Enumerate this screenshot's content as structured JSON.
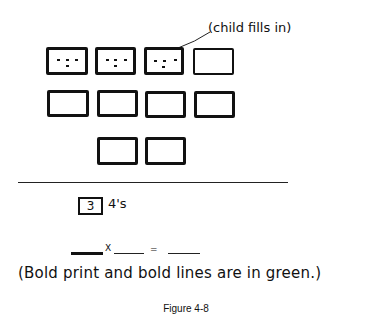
{
  "annotation": {
    "label": "(child fills in)"
  },
  "grid": {
    "rows": [
      {
        "boxes": [
          {
            "dots": 3
          },
          {
            "dots": 3
          },
          {
            "dots": 3,
            "child_filled": true
          },
          {
            "dots": 0
          }
        ]
      },
      {
        "boxes": [
          {
            "dots": 0
          },
          {
            "dots": 0
          },
          {
            "dots": 0
          },
          {
            "dots": 0
          }
        ]
      },
      {
        "boxes": [
          {
            "dots": 0
          },
          {
            "dots": 0
          }
        ]
      }
    ],
    "dots_per_filled_box": 3,
    "total_boxes": 10
  },
  "group_label": {
    "count": "3",
    "unit": "4's"
  },
  "equation": {
    "times_symbol": "X",
    "equals_symbol": "="
  },
  "note": "(Bold print and bold lines are in green.)",
  "caption": "Figure 4-8"
}
